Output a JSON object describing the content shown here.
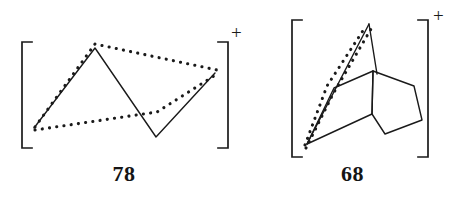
{
  "figure": {
    "type": "chemical-structure-pair",
    "background_color": "#ffffff",
    "line_color": "#1a1a1a",
    "caption_color": "#151515",
    "structures": [
      {
        "id": "structure-78",
        "label": "78",
        "charge_superscript": "+",
        "bracket_style": "square",
        "description": "cation drawn inside square brackets with solid and dotted bonds",
        "solid_path": "M 34,128 L 95,48 L 156,137 L 215,73",
        "dotted_paths": [
          "M 34,128 L 95,44 L 216,70",
          "M 34,130 L 156,113 L 216,74"
        ],
        "bracket_left": {
          "x": 22,
          "y_top": 42,
          "y_bottom": 148,
          "tick": 10
        },
        "bracket_right": {
          "x": 228,
          "y_top": 42,
          "y_bottom": 148,
          "tick": 10
        },
        "plus_position": {
          "x": 233,
          "y": 32
        }
      },
      {
        "id": "structure-68",
        "label": "68",
        "charge_superscript": "+",
        "bracket_style": "square",
        "description": "norbornyl-type cage cation inside square brackets with solid and dotted bonds",
        "solid_paths": [
          "M 307,143 L 333,88 L 371,71",
          "M 307,143 L 370,23 L 374,72 L 371,113",
          "M 370,23 L 377,73",
          "M 371,71 L 413,86 L 422,120 L 384,133 L 371,113 L 371,71",
          "M 307,143 L 371,113"
        ],
        "dotted_paths": [
          "M 305,145 L 327,86 L 368,25",
          "M 305,147 L 332,93 L 372,27"
        ],
        "bracket_left": {
          "x": 292,
          "y_top": 20,
          "y_bottom": 157,
          "tick": 10
        },
        "bracket_right": {
          "x": 428,
          "y_top": 20,
          "y_bottom": 157,
          "tick": 10
        },
        "plus_position": {
          "x": 437,
          "y": 16
        }
      }
    ]
  }
}
